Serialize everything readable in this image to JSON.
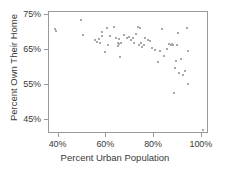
{
  "chart_data": {
    "type": "scatter",
    "title": "",
    "xlabel": "Percent Urban Population",
    "ylabel": "Percent Own Their Home",
    "xlim": [
      36,
      103
    ],
    "ylim": [
      41,
      76
    ],
    "grid": false,
    "legend": null,
    "marker_color": "#a8a8a8",
    "frame_color": "#9a9a9a",
    "xticks": [
      {
        "value": 40,
        "label": "40%"
      },
      {
        "value": 60,
        "label": "60%"
      },
      {
        "value": 80,
        "label": "80%"
      },
      {
        "value": 100,
        "label": "100%"
      }
    ],
    "yticks": [
      {
        "value": 45,
        "label": "45%"
      },
      {
        "value": 55,
        "label": "55%"
      },
      {
        "value": 65,
        "label": "65%"
      },
      {
        "value": 75,
        "label": "75%"
      }
    ],
    "points": [
      [
        38.7,
        71.0
      ],
      [
        38.9,
        70.6
      ],
      [
        49.6,
        73.6
      ],
      [
        50.1,
        69.4
      ],
      [
        55.4,
        68.0
      ],
      [
        56.0,
        67.4
      ],
      [
        56.8,
        68.2
      ],
      [
        57.2,
        67.1
      ],
      [
        58.0,
        69.0
      ],
      [
        58.4,
        70.2
      ],
      [
        59.4,
        64.6
      ],
      [
        60.3,
        71.3
      ],
      [
        60.6,
        66.4
      ],
      [
        61.4,
        69.1
      ],
      [
        63.4,
        71.6
      ],
      [
        64.2,
        68.5
      ],
      [
        64.8,
        67.0
      ],
      [
        65.0,
        66.2
      ],
      [
        65.2,
        68.2
      ],
      [
        65.4,
        66.8
      ],
      [
        65.6,
        63.0
      ],
      [
        66.2,
        67.2
      ],
      [
        67.4,
        69.5
      ],
      [
        68.6,
        68.6
      ],
      [
        69.4,
        68.9
      ],
      [
        70.3,
        68.1
      ],
      [
        71.2,
        68.4
      ],
      [
        71.8,
        67.0
      ],
      [
        72.6,
        69.6
      ],
      [
        73.2,
        71.8
      ],
      [
        73.6,
        66.4
      ],
      [
        74.0,
        71.4
      ],
      [
        74.4,
        67.2
      ],
      [
        74.8,
        66.0
      ],
      [
        75.6,
        66.6
      ],
      [
        76.2,
        68.4
      ],
      [
        77.4,
        67.9
      ],
      [
        78.2,
        67.8
      ],
      [
        79.0,
        65.8
      ],
      [
        80.4,
        65.0
      ],
      [
        81.6,
        61.6
      ],
      [
        82.6,
        64.8
      ],
      [
        83.2,
        71.0
      ],
      [
        84.0,
        63.4
      ],
      [
        85.4,
        65.4
      ],
      [
        86.4,
        66.8
      ],
      [
        87.0,
        66.6
      ],
      [
        87.4,
        66.8
      ],
      [
        87.8,
        66.5
      ],
      [
        88.2,
        52.8
      ],
      [
        88.6,
        60.0
      ],
      [
        89.0,
        62.0
      ],
      [
        89.4,
        66.6
      ],
      [
        90.2,
        70.0
      ],
      [
        90.6,
        58.4
      ],
      [
        91.2,
        62.4
      ],
      [
        92.0,
        57.8
      ],
      [
        93.0,
        59.0
      ],
      [
        93.6,
        71.4
      ],
      [
        94.0,
        64.8
      ],
      [
        94.4,
        55.4
      ],
      [
        100.5,
        42.2
      ]
    ]
  }
}
